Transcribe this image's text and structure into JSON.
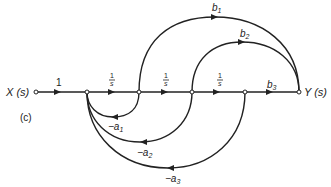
{
  "diagram": {
    "type": "signal-flow-graph",
    "panel_label": "(c)",
    "input_node": "X (s)",
    "output_node": "Y (s)",
    "forward_gains": {
      "input": "1",
      "int1": "1/s",
      "int2": "1/s",
      "int3": "1/s",
      "b3": "b",
      "b3_sub": "3"
    },
    "feedforward": [
      {
        "label": "b",
        "sub": "1"
      },
      {
        "label": "b",
        "sub": "2"
      }
    ],
    "feedback": [
      {
        "label": "−a",
        "sub": "1"
      },
      {
        "label": "−a",
        "sub": "2"
      },
      {
        "label": "−a",
        "sub": "3"
      }
    ],
    "frac_num": "1",
    "frac_den": "s"
  }
}
